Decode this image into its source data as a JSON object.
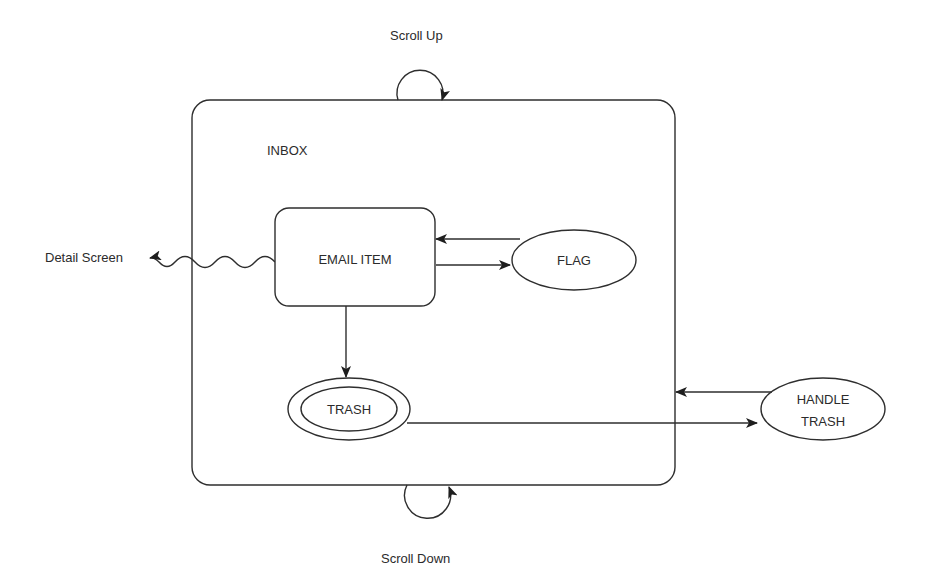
{
  "diagram": {
    "container": {
      "label": "INBOX"
    },
    "states": {
      "email_item": {
        "label": "EMAIL ITEM",
        "shape": "rounded-rectangle"
      },
      "flag": {
        "label": "FLAG",
        "shape": "ellipse"
      },
      "trash": {
        "label": "TRASH",
        "shape": "double-ellipse"
      },
      "handle_trash": {
        "label_line1": "HANDLE",
        "label_line2": "TRASH",
        "shape": "ellipse"
      }
    },
    "external_labels": {
      "scroll_up": "Scroll Up",
      "scroll_down": "Scroll Down",
      "detail_screen": "Detail Screen"
    },
    "transitions": [
      {
        "from": "INBOX",
        "to": "INBOX",
        "label": "Scroll Up",
        "style": "self-loop"
      },
      {
        "from": "INBOX",
        "to": "INBOX",
        "label": "Scroll Down",
        "style": "self-loop"
      },
      {
        "from": "EMAIL ITEM",
        "to": "Detail Screen",
        "style": "wavy"
      },
      {
        "from": "EMAIL ITEM",
        "to": "FLAG",
        "style": "arrow"
      },
      {
        "from": "FLAG",
        "to": "EMAIL ITEM",
        "style": "arrow"
      },
      {
        "from": "EMAIL ITEM",
        "to": "TRASH",
        "style": "arrow"
      },
      {
        "from": "TRASH",
        "to": "HANDLE TRASH",
        "style": "arrow"
      },
      {
        "from": "HANDLE TRASH",
        "to": "INBOX",
        "style": "arrow"
      }
    ],
    "colors": {
      "line": "#2e2e2e",
      "text": "#2b2b2b",
      "background": "#ffffff"
    }
  }
}
